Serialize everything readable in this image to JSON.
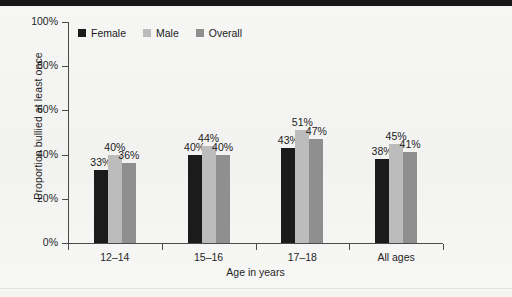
{
  "chart_data": {
    "type": "bar",
    "title": "",
    "xlabel": "Age in years",
    "ylabel": "Proportion bullied at least once",
    "categories": [
      "12–14",
      "15–16",
      "17–18",
      "All ages"
    ],
    "series": [
      {
        "name": "Female",
        "color": "#1b1b1b",
        "values": [
          33,
          40,
          43,
          38
        ],
        "labels": [
          "33%",
          "40%",
          "43%",
          "38%"
        ]
      },
      {
        "name": "Male",
        "color": "#bcbcbc",
        "values": [
          40,
          44,
          51,
          45
        ],
        "labels": [
          "40%",
          "44%",
          "51%",
          "45%"
        ]
      },
      {
        "name": "Overall",
        "color": "#8f8f8f",
        "values": [
          36,
          40,
          47,
          41
        ],
        "labels": [
          "36%",
          "40%",
          "47%",
          "41%"
        ]
      }
    ],
    "ylim": [
      0,
      100
    ],
    "yticks": [
      0,
      20,
      40,
      60,
      80,
      100
    ],
    "ytick_labels": [
      "0%",
      "20%",
      "40%",
      "60%",
      "80%",
      "100%"
    ],
    "grid": false,
    "legend_position": "top-left",
    "value_labels": true,
    "units": "percent"
  },
  "legend": {
    "items": [
      {
        "label": "Female",
        "swatch": "legend-swatch-female"
      },
      {
        "label": "Male",
        "swatch": "legend-swatch-male"
      },
      {
        "label": "Overall",
        "swatch": "legend-swatch-overall"
      }
    ]
  },
  "colors": {
    "female": "#1b1b1b",
    "male": "#bcbcbc",
    "overall": "#8f8f8f",
    "axis": "#4a4a4a",
    "background": "#f4f4f3",
    "text": "#1f1f1f"
  }
}
